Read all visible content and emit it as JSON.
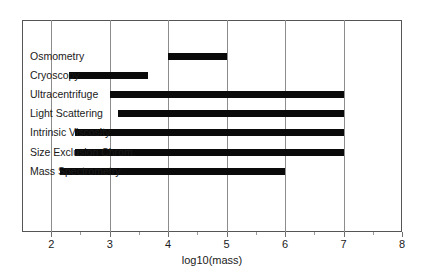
{
  "chart_data": {
    "type": "bar",
    "orientation": "horizontal",
    "title": "",
    "xlabel": "log10(mass)",
    "ylabel": "",
    "xlim": [
      1.5,
      8
    ],
    "xticks": [
      2,
      3,
      4,
      5,
      6,
      7,
      8
    ],
    "xtick_labels": [
      "2",
      "3",
      "4",
      "5",
      "6",
      "7",
      "8"
    ],
    "grid": "vertical",
    "legend": "none",
    "categories": [
      "Osmometry",
      "Cryoscopy",
      "Ultracentrifuge",
      "Light Scattering",
      "Intrinsic Viscosity",
      "Size Exclusion Chrom.",
      "Mass Spectrometry"
    ],
    "ranges": [
      {
        "label": "Osmometry",
        "start": 4.0,
        "end": 5.0
      },
      {
        "label": "Cryoscopy",
        "start": 2.3,
        "end": 3.65
      },
      {
        "label": "Ultracentrifuge",
        "start": 3.0,
        "end": 7.0
      },
      {
        "label": "Light Scattering",
        "start": 3.15,
        "end": 7.0
      },
      {
        "label": "Intrinsic Viscosity",
        "start": 2.4,
        "end": 7.0
      },
      {
        "label": "Size Exclusion Chrom.",
        "start": 2.4,
        "end": 7.0
      },
      {
        "label": "Mass Spectrometry",
        "start": 2.15,
        "end": 6.0
      }
    ],
    "bar_color": "#0a0a0a",
    "frame_color": "#555555",
    "grid_color": "#8c8c8c",
    "background": "#ffffff"
  }
}
